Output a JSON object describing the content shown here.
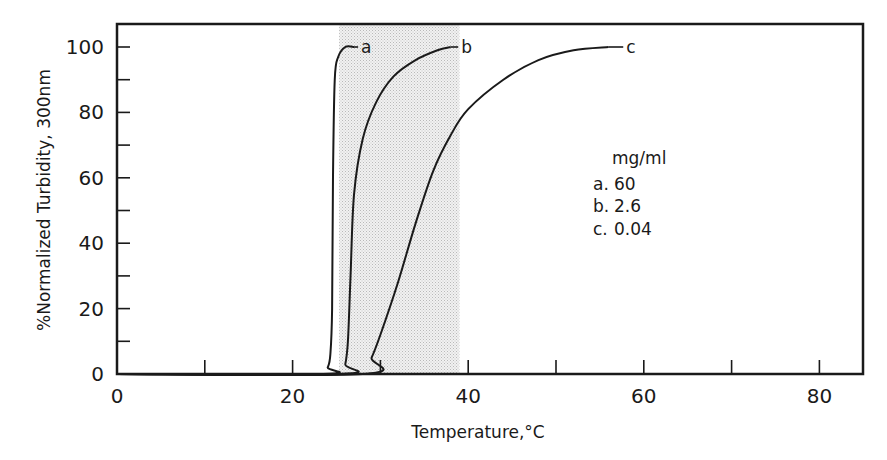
{
  "chart_data": {
    "type": "line",
    "title": "",
    "xlabel": "Temperature,°C",
    "ylabel": "%Normalized Turbidity, 300nm",
    "xlim": [
      0,
      85
    ],
    "ylim": [
      0,
      108
    ],
    "x_ticks": [
      0,
      20,
      40,
      60,
      80
    ],
    "x_minor_ticks": [
      10,
      30,
      50,
      70
    ],
    "y_ticks": [
      0,
      20,
      40,
      60,
      80,
      100
    ],
    "y_minor_ticks": [
      10,
      30,
      50,
      70,
      90
    ],
    "grid": false,
    "shaded_region": {
      "x_start": 25.3,
      "x_end": 39.0,
      "style": "stippled gray"
    },
    "legend": {
      "title": "mg/ml",
      "position": "right-center inside plot",
      "entries": [
        {
          "key": "a.",
          "value": "60"
        },
        {
          "key": "b.",
          "value": "2.6"
        },
        {
          "key": "c.",
          "value": "0.04"
        }
      ]
    },
    "series": [
      {
        "name": "a",
        "concentration_mg_ml": 60,
        "x": [
          0,
          23.5,
          24.0,
          24.3,
          24.5,
          24.6,
          24.8,
          25.2,
          26.0,
          27.0
        ],
        "y": [
          0,
          0,
          2,
          6,
          20,
          60,
          90,
          97,
          100,
          100
        ]
      },
      {
        "name": "b",
        "concentration_mg_ml": 2.6,
        "x": [
          0,
          25.5,
          26.0,
          26.3,
          26.6,
          27.0,
          28.0,
          29.5,
          31.5,
          34.0,
          36.5,
          38.0
        ],
        "y": [
          0,
          0,
          3,
          10,
          30,
          55,
          72,
          83,
          91,
          96,
          99,
          100
        ]
      },
      {
        "name": "c",
        "concentration_mg_ml": 0.04,
        "x": [
          0,
          28.0,
          29.0,
          30.0,
          32.0,
          34.0,
          36.0,
          38.0,
          40.0,
          44.0,
          48.0,
          52.0,
          56.0
        ],
        "y": [
          0,
          0,
          5,
          12,
          28,
          46,
          62,
          73,
          81,
          90,
          96,
          99,
          100
        ]
      }
    ],
    "curve_labels": [
      {
        "text": "a",
        "x": 27.8,
        "y": 100
      },
      {
        "text": "b",
        "x": 39.2,
        "y": 100
      },
      {
        "text": "c",
        "x": 58.0,
        "y": 100
      }
    ]
  }
}
